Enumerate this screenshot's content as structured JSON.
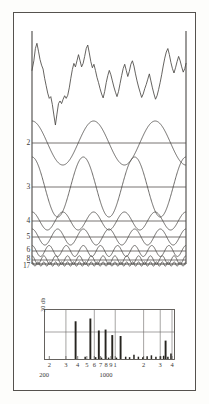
{
  "figure": {
    "border_color": "#55524e",
    "ink_color": "#3a3836",
    "paper_color": "#fdfdfb"
  },
  "wave_panel": {
    "name": "harmonic-decomposition-panel",
    "frame": {
      "left_axis": true,
      "right_axis": true,
      "baseline": true
    },
    "composite_label": "",
    "row_labels": [
      "2",
      "3",
      "4",
      "5",
      "6",
      "8",
      "17"
    ]
  },
  "spectrum_panel": {
    "name": "line-spectrum-panel",
    "y_axis_label": "30 db",
    "tick_labels": [
      "2",
      "3",
      "4",
      "5",
      "6",
      "7",
      "8",
      "9",
      "1",
      "2",
      "3",
      "4"
    ],
    "decade_labels": [
      "200",
      "1000"
    ]
  },
  "chart_data": [
    {
      "type": "line",
      "name": "composite-waveform",
      "title": "",
      "xlabel": "",
      "ylabel": "",
      "xlim": [
        0,
        1
      ],
      "ylim": [
        -1,
        1
      ],
      "grid": false,
      "x": [
        0,
        0.012,
        0.022,
        0.032,
        0.042,
        0.052,
        0.062,
        0.072,
        0.082,
        0.092,
        0.102,
        0.112,
        0.122,
        0.132,
        0.142,
        0.152,
        0.162,
        0.172,
        0.182,
        0.192,
        0.202,
        0.212,
        0.222,
        0.232,
        0.242,
        0.252,
        0.262,
        0.272,
        0.282,
        0.292,
        0.302,
        0.312,
        0.322,
        0.332,
        0.342,
        0.352,
        0.362,
        0.372,
        0.382,
        0.392,
        0.402,
        0.412,
        0.422,
        0.432,
        0.442,
        0.452,
        0.462,
        0.472,
        0.482,
        0.492,
        0.502,
        0.512,
        0.522,
        0.532,
        0.542,
        0.552,
        0.562,
        0.572,
        0.582,
        0.592,
        0.602,
        0.612,
        0.622,
        0.632,
        0.642,
        0.652,
        0.662,
        0.672,
        0.682,
        0.692,
        0.702,
        0.712,
        0.722,
        0.732,
        0.742,
        0.752,
        0.762,
        0.772,
        0.782,
        0.792,
        0.802,
        0.812,
        0.822,
        0.832,
        0.842,
        0.852,
        0.862,
        0.872,
        0.882,
        0.892,
        0.902,
        0.912,
        0.922,
        0.932,
        0.942,
        0.952,
        0.962,
        0.972,
        0.982,
        0.992,
        1.0
      ],
      "y": [
        0.3,
        0.52,
        0.8,
        0.92,
        0.74,
        0.55,
        0.42,
        0.33,
        0.12,
        -0.05,
        -0.22,
        -0.34,
        -0.3,
        -0.48,
        -0.72,
        -0.95,
        -0.7,
        -0.46,
        -0.4,
        -0.46,
        -0.36,
        -0.28,
        -0.34,
        -0.27,
        -0.1,
        0.12,
        0.32,
        0.46,
        0.38,
        0.52,
        0.66,
        0.52,
        0.38,
        0.46,
        0.62,
        0.8,
        0.88,
        0.7,
        0.5,
        0.36,
        0.44,
        0.3,
        0.14,
        0.02,
        -0.12,
        -0.24,
        -0.33,
        -0.18,
        0.02,
        0.18,
        0.3,
        0.2,
        0.06,
        -0.08,
        -0.2,
        -0.3,
        -0.18,
        0.0,
        0.18,
        0.34,
        0.44,
        0.3,
        0.16,
        0.28,
        0.44,
        0.52,
        0.4,
        0.22,
        0.06,
        -0.08,
        -0.2,
        -0.32,
        -0.24,
        -0.12,
        -0.02,
        0.1,
        0.22,
        0.06,
        -0.1,
        -0.24,
        -0.36,
        -0.28,
        -0.14,
        0.02,
        0.2,
        0.4,
        0.58,
        0.72,
        0.8,
        0.66,
        0.48,
        0.34,
        0.24,
        0.36,
        0.5,
        0.62,
        0.52,
        0.38,
        0.26,
        0.34,
        0.46
      ]
    },
    {
      "type": "line",
      "name": "harmonic-component-2",
      "order": 2,
      "cycles": 2.5,
      "amplitude": 0.92,
      "phase_deg": 90,
      "baseline_label": "2"
    },
    {
      "type": "line",
      "name": "harmonic-component-3",
      "order": 3,
      "cycles": 3,
      "amplitude": 1.0,
      "phase_deg": 90,
      "baseline_label": "3"
    },
    {
      "type": "line",
      "name": "harmonic-component-4",
      "order": 4,
      "cycles": 5,
      "amplitude": 0.3,
      "phase_deg": 90,
      "baseline_label": "4"
    },
    {
      "type": "line",
      "name": "harmonic-component-5",
      "order": 5,
      "cycles": 6,
      "amplitude": 0.26,
      "phase_deg": 90,
      "baseline_label": "5"
    },
    {
      "type": "line",
      "name": "harmonic-component-6",
      "order": 6,
      "cycles": 9,
      "amplitude": 0.17,
      "phase_deg": 90,
      "baseline_label": "6"
    },
    {
      "type": "line",
      "name": "harmonic-component-8",
      "order": 8,
      "cycles": 13,
      "amplitude": 0.13,
      "phase_deg": 90,
      "baseline_label": "8"
    },
    {
      "type": "line",
      "name": "harmonic-component-17",
      "order": 17,
      "cycles": 26,
      "amplitude": 0.06,
      "phase_deg": 90,
      "baseline_label": "17"
    },
    {
      "type": "bar",
      "name": "line-spectrum",
      "title": "",
      "xlabel": "",
      "ylabel": "30 db",
      "xscale": "log",
      "xlim": [
        180,
        4200
      ],
      "ylim": [
        0,
        1
      ],
      "grid": true,
      "categories": [
        380,
        480,
        545,
        620,
        670,
        715,
        790,
        850,
        930,
        1030,
        1140,
        1290,
        1420,
        1580,
        1760,
        1960,
        2180,
        2420,
        2700,
        3020,
        3260,
        3420,
        3620,
        3900
      ],
      "values": [
        0.82,
        0.05,
        0.88,
        0.04,
        0.62,
        0.03,
        0.64,
        0.03,
        0.52,
        0.03,
        0.5,
        0.05,
        0.04,
        0.09,
        0.05,
        0.04,
        0.06,
        0.08,
        0.05,
        0.06,
        0.07,
        0.4,
        0.05,
        0.12
      ],
      "gridlines_x": [
        300,
        600,
        1000,
        2000,
        3000,
        4000
      ]
    }
  ]
}
